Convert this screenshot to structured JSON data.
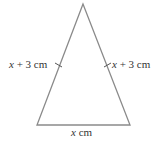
{
  "diagram": {
    "type": "isosceles-triangle",
    "stroke_color": "#8a8a8a",
    "labels": {
      "left_side": {
        "var": "x",
        "rest": " + 3 cm"
      },
      "right_side": {
        "var": "x",
        "rest": " + 3 cm"
      },
      "base": {
        "var": "x",
        "rest": " cm"
      }
    },
    "equal_side_tick_marks": 2
  }
}
